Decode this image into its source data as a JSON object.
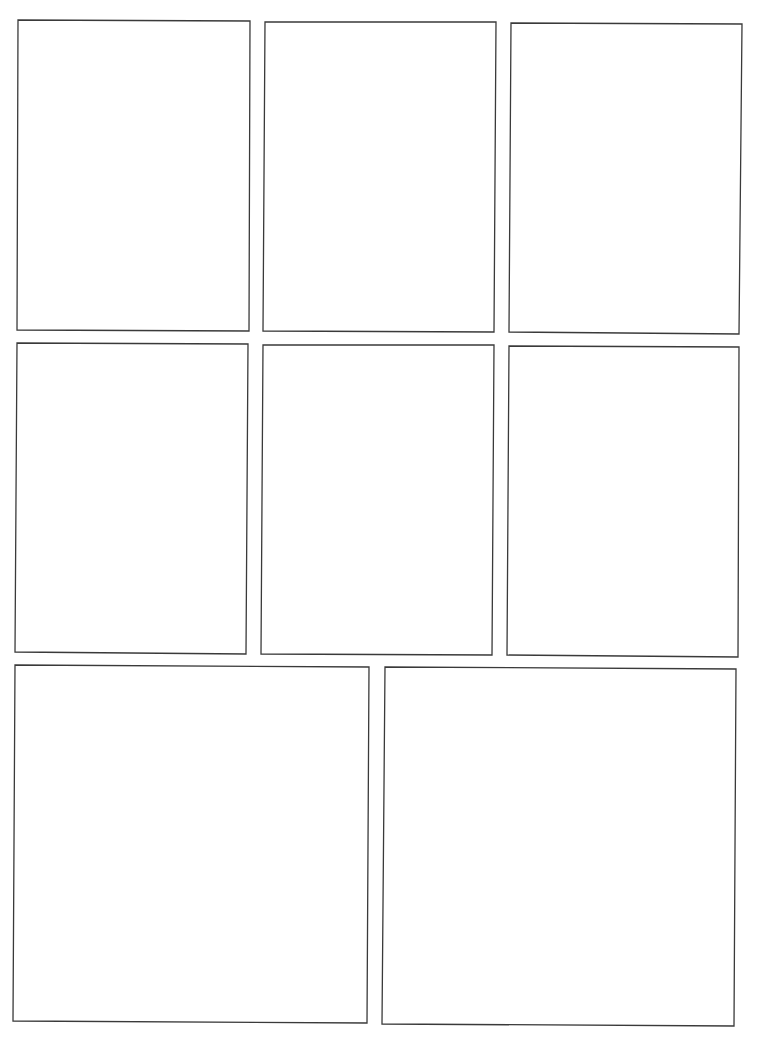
{
  "page": {
    "background": "#ffffff",
    "border_color": "#3a3a3a",
    "layout": "comic-panel-template",
    "rows": [
      {
        "panels": [
          {
            "id": "panel-1",
            "points": "18,20 250,21 249,331 17,330"
          },
          {
            "id": "panel-2",
            "points": "265,22 496,22 494,332 263,331"
          },
          {
            "id": "panel-3",
            "points": "511,23 742,24 739,334 509,332"
          }
        ]
      },
      {
        "panels": [
          {
            "id": "panel-4",
            "points": "17,343 248,344 246,654 15,652"
          },
          {
            "id": "panel-5",
            "points": "263,345 494,345 492,655 261,654"
          },
          {
            "id": "panel-6",
            "points": "509,346 739,347 738,657 507,655"
          }
        ]
      },
      {
        "panels": [
          {
            "id": "panel-7",
            "points": "15,665 369,667 367,1023 13,1021"
          },
          {
            "id": "panel-8",
            "points": "385,667 736,669 734,1026 382,1024"
          }
        ]
      }
    ]
  }
}
